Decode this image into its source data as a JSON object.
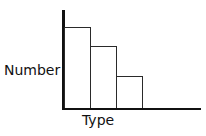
{
  "chart_data": {
    "type": "bar",
    "title": "",
    "xlabel": "Type",
    "ylabel": "Number",
    "categories": [
      "",
      "",
      ""
    ],
    "values": [
      81,
      62,
      32
    ],
    "ylim": [
      0,
      100
    ],
    "grid": false,
    "legend": null,
    "bar_fill": "#ffffff",
    "bar_edge": "#2a2a2a",
    "axis_color": "#111111"
  }
}
